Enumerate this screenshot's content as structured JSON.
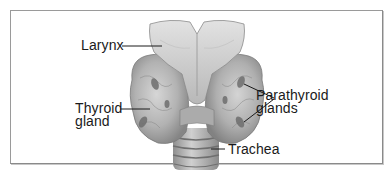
{
  "diagram": {
    "type": "anatomical-illustration",
    "labels": {
      "larynx": "Larynx",
      "thyroid_line1": "Thyroid",
      "thyroid_line2": "gland",
      "parathyroid_line1": "Parathyroid",
      "parathyroid_line2": "glands",
      "trachea": "Trachea"
    },
    "colors": {
      "frame": "#8a8a8a",
      "tissue_light": "#d8d8d8",
      "tissue_mid": "#a9a9a9",
      "tissue_dark": "#6e6e6e",
      "leader_line": "#1a1a1a",
      "text": "#1a1a1a"
    }
  }
}
